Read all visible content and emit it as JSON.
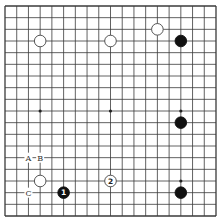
{
  "board": {
    "size": 19,
    "line_color": "#3a3a3a",
    "background": "#ffffff",
    "star_points": [
      [
        3,
        3
      ],
      [
        3,
        9
      ],
      [
        3,
        15
      ],
      [
        9,
        3
      ],
      [
        9,
        9
      ],
      [
        9,
        15
      ],
      [
        15,
        3
      ],
      [
        15,
        9
      ],
      [
        15,
        15
      ]
    ]
  },
  "stones": [
    {
      "color": "white",
      "col": 3,
      "row": 3,
      "label": ""
    },
    {
      "color": "white",
      "col": 9,
      "row": 3,
      "label": ""
    },
    {
      "color": "white",
      "col": 13,
      "row": 2,
      "label": ""
    },
    {
      "color": "black",
      "col": 15,
      "row": 3,
      "label": ""
    },
    {
      "color": "black",
      "col": 15,
      "row": 10,
      "label": ""
    },
    {
      "color": "black",
      "col": 15,
      "row": 16,
      "label": ""
    },
    {
      "color": "white",
      "col": 3,
      "row": 15,
      "label": ""
    },
    {
      "color": "black",
      "col": 5,
      "row": 16,
      "label": "1"
    },
    {
      "color": "white",
      "col": 9,
      "row": 15,
      "label": "2"
    }
  ],
  "markers": [
    {
      "text": "A",
      "col": 2,
      "row": 13
    },
    {
      "text": "B",
      "col": 3,
      "row": 13
    },
    {
      "text": "C",
      "col": 2,
      "row": 16
    }
  ]
}
